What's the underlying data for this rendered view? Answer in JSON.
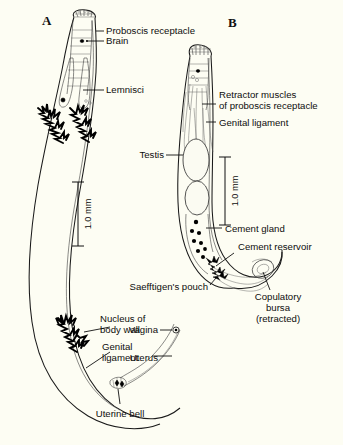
{
  "figure": {
    "background_color": "#fdfdf3",
    "ink_color": "#111111"
  },
  "panels": [
    {
      "id": "A",
      "letter": "A",
      "subject": "female"
    },
    {
      "id": "B",
      "letter": "B",
      "subject": "male"
    }
  ],
  "scale_bars": [
    {
      "id": "scale-a",
      "label": "1.0 mm"
    },
    {
      "id": "scale-b",
      "label": "1.0 mm"
    }
  ],
  "labels": {
    "proboscis_receptacle": "Proboscis receptacle",
    "brain": "Brain",
    "lemnisci": "Lemnisci",
    "nucleus_of_body_wall_line1": "Nucleus of",
    "nucleus_of_body_wall_line2": "body wall",
    "genital_ligament_a_line1": "Genital",
    "genital_ligament_a_line2": "ligament",
    "uterine_bell": "Uterine bell",
    "uterus": "Uterus",
    "vagina": "Vagina",
    "retractor_muscles_line1": "Retractor muscles",
    "retractor_muscles_line2": "of proboscis receptacle",
    "genital_ligament_b": "Genital ligament",
    "testis": "Testis",
    "cement_gland": "Cement gland",
    "cement_reservoir": "Cement reservoir",
    "saefftigens_pouch": "Saefftigen's pouch",
    "copulatory_bursa_line1": "Copulatory",
    "copulatory_bursa_line2": "bursa",
    "copulatory_bursa_line3": "(retracted)"
  }
}
